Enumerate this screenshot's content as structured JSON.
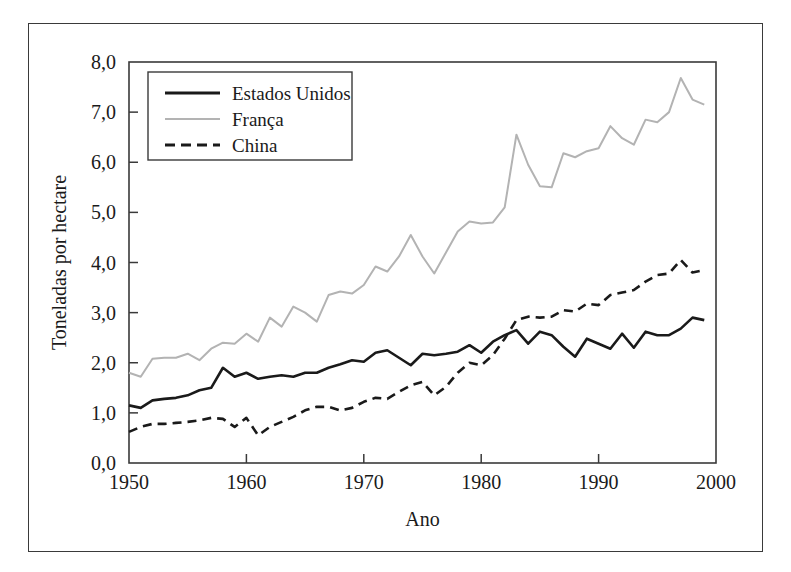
{
  "figure": {
    "name": "grain-yield-line-chart"
  },
  "chart_data": {
    "type": "line",
    "title": "",
    "xlabel": "Ano",
    "ylabel": "Toneladas por hectare",
    "xlim": [
      1950,
      2000
    ],
    "ylim": [
      0,
      8
    ],
    "grid": false,
    "legend_position": "top-left",
    "xticks": [
      1950,
      1960,
      1970,
      1980,
      1990,
      2000
    ],
    "xtick_labels": [
      "1950",
      "1960",
      "1970",
      "1980",
      "1990",
      "2000"
    ],
    "yticks": [
      0,
      1,
      2,
      3,
      4,
      5,
      6,
      7,
      8
    ],
    "ytick_labels": [
      "0,0",
      "1,0",
      "2,0",
      "3,0",
      "4,0",
      "5,0",
      "6,0",
      "7,0",
      "8,0"
    ],
    "x": [
      1950,
      1951,
      1952,
      1953,
      1954,
      1955,
      1956,
      1957,
      1958,
      1959,
      1960,
      1961,
      1962,
      1963,
      1964,
      1965,
      1966,
      1967,
      1968,
      1969,
      1970,
      1971,
      1972,
      1973,
      1974,
      1975,
      1976,
      1977,
      1978,
      1979,
      1980,
      1981,
      1982,
      1983,
      1984,
      1985,
      1986,
      1987,
      1988,
      1989,
      1990,
      1991,
      1992,
      1993,
      1994,
      1995,
      1996,
      1997,
      1998,
      1999
    ],
    "series": [
      {
        "name": "Estados Unidos",
        "color": "#1a1a1a",
        "style": "solid",
        "values": [
          1.15,
          1.1,
          1.25,
          1.28,
          1.3,
          1.35,
          1.45,
          1.5,
          1.9,
          1.72,
          1.8,
          1.68,
          1.72,
          1.75,
          1.72,
          1.8,
          1.8,
          1.9,
          1.97,
          2.05,
          2.02,
          2.2,
          2.25,
          2.1,
          1.95,
          2.18,
          2.15,
          2.18,
          2.22,
          2.35,
          2.2,
          2.42,
          2.55,
          2.65,
          2.38,
          2.62,
          2.55,
          2.32,
          2.12,
          2.48,
          2.38,
          2.28,
          2.58,
          2.3,
          2.62,
          2.55,
          2.55,
          2.68,
          2.9,
          2.85
        ]
      },
      {
        "name": "França",
        "color": "#b3b3b3",
        "style": "solid",
        "values": [
          1.8,
          1.72,
          2.08,
          2.1,
          2.1,
          2.18,
          2.05,
          2.28,
          2.4,
          2.38,
          2.58,
          2.42,
          2.9,
          2.72,
          3.12,
          3.0,
          2.82,
          3.35,
          3.42,
          3.38,
          3.55,
          3.92,
          3.82,
          4.12,
          4.55,
          4.12,
          3.78,
          4.2,
          4.62,
          4.82,
          4.78,
          4.8,
          5.1,
          6.55,
          5.95,
          5.52,
          5.5,
          6.18,
          6.1,
          6.22,
          6.28,
          6.72,
          6.48,
          6.35,
          6.85,
          6.8,
          7.0,
          7.68,
          7.25,
          7.15
        ]
      },
      {
        "name": "China",
        "color": "#1a1a1a",
        "style": "dashed",
        "values": [
          0.62,
          0.72,
          0.78,
          0.78,
          0.8,
          0.82,
          0.85,
          0.9,
          0.88,
          0.72,
          0.9,
          0.55,
          0.72,
          0.82,
          0.92,
          1.05,
          1.12,
          1.12,
          1.05,
          1.1,
          1.22,
          1.3,
          1.28,
          1.42,
          1.55,
          1.62,
          1.35,
          1.52,
          1.8,
          2.0,
          1.95,
          2.15,
          2.48,
          2.85,
          2.92,
          2.9,
          2.92,
          3.05,
          3.02,
          3.18,
          3.15,
          3.35,
          3.4,
          3.45,
          3.62,
          3.75,
          3.78,
          4.05,
          3.8,
          3.85
        ]
      }
    ],
    "legend": [
      {
        "label": "Estados Unidos",
        "color": "#1a1a1a",
        "style": "solid"
      },
      {
        "label": "França",
        "color": "#b3b3b3",
        "style": "solid"
      },
      {
        "label": "China",
        "color": "#1a1a1a",
        "style": "dashed"
      }
    ]
  },
  "colors": {
    "frame": "#3a3a3a",
    "text": "#1a1a1a",
    "us": "#1a1a1a",
    "france": "#b3b3b3",
    "china": "#1a1a1a",
    "background": "#ffffff"
  }
}
